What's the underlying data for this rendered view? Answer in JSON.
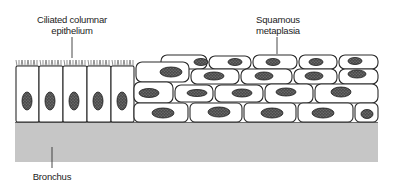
{
  "figure": {
    "labels": {
      "ciliated": {
        "line1": "Ciliated columnar",
        "line2": "epithelium"
      },
      "squamous": {
        "line1": "Squamous",
        "line2": "metaplasia"
      },
      "bronchus": {
        "line1": "Bronchus"
      }
    },
    "colors": {
      "basement": "#c6c6c6",
      "cell_fill": "#ffffff",
      "cell_outline": "#2a2a2a",
      "nucleus": "#5a5a5a"
    },
    "regions": [
      {
        "name": "ciliated-columnar-epithelium",
        "cell_count": 5
      },
      {
        "name": "squamous-metaplasia",
        "rows": 4
      },
      {
        "name": "bronchus-wall"
      }
    ]
  }
}
